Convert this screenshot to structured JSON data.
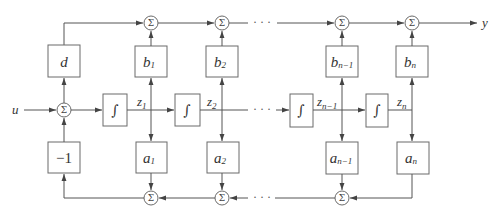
{
  "diagram": {
    "type": "block diagram (controllable canonical / state-space realization)",
    "input_label": "u",
    "output_label": "y",
    "sum_symbol": "Σ",
    "integrator_symbol": "∫",
    "ellipsis": "· · ·",
    "feedthrough_gain": "d",
    "feedback_gain": "−1",
    "output_gains": [
      {
        "base": "b",
        "sub": "1"
      },
      {
        "base": "b",
        "sub": "2"
      },
      {
        "base": "b",
        "sub": "n−1"
      },
      {
        "base": "b",
        "sub": "n"
      }
    ],
    "feedback_gains": [
      {
        "base": "a",
        "sub": "1"
      },
      {
        "base": "a",
        "sub": "2"
      },
      {
        "base": "a",
        "sub": "n−1"
      },
      {
        "base": "a",
        "sub": "n"
      }
    ],
    "states": [
      {
        "base": "z",
        "sub": "1"
      },
      {
        "base": "z",
        "sub": "2"
      },
      {
        "base": "z",
        "sub": "n−1"
      },
      {
        "base": "z",
        "sub": "n"
      }
    ]
  }
}
